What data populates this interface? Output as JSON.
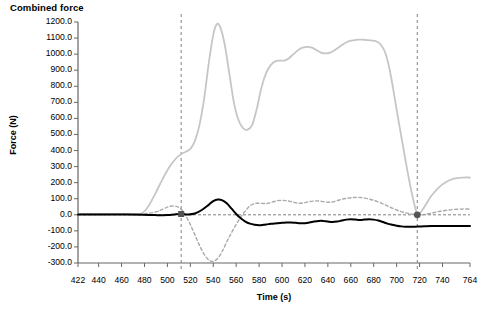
{
  "chart_data": {
    "type": "line",
    "title": "Combined force",
    "xlabel": "Time (s)",
    "ylabel": "Force (N)",
    "xlim": [
      422,
      764
    ],
    "ylim": [
      -300,
      1200
    ],
    "grid": false,
    "legend": "none",
    "y_ticks": [
      1200.0,
      1100.0,
      1000.0,
      900.0,
      800.0,
      700.0,
      600.0,
      500.0,
      400.0,
      300.0,
      200.0,
      100.0,
      0.0,
      -100.0,
      -200.0,
      -300.0
    ],
    "y_tick_labels": [
      "1200.0",
      "1100.0",
      "1000.0",
      "900.0",
      "800.0",
      "700.0",
      "600.0",
      "500.0",
      "400.0",
      "300.0",
      "200.0",
      "100.0",
      "0.0",
      "-100.0",
      "-200.0",
      "-300.0"
    ],
    "x_ticks": [
      422,
      440,
      460,
      480,
      500,
      520,
      540,
      560,
      580,
      600,
      620,
      640,
      660,
      680,
      700,
      720,
      740,
      764
    ],
    "x_tick_labels": [
      "422",
      "440",
      "460",
      "480",
      "500",
      "520",
      "540",
      "560",
      "580",
      "600",
      "620",
      "640",
      "660",
      "680",
      "700",
      "720",
      "740",
      "764"
    ],
    "annotations": {
      "zero_line": {
        "y": 0,
        "style": "dashed",
        "color": "#808080"
      },
      "vertical_markers": [
        {
          "x": 512,
          "style": "dashed",
          "color": "#808080"
        },
        {
          "x": 718,
          "style": "dashed",
          "color": "#808080"
        }
      ],
      "point_markers": [
        {
          "x": 512,
          "y": 5,
          "shape": "square",
          "color": "#555555",
          "series": "combined-force"
        },
        {
          "x": 718,
          "y": 0,
          "shape": "circle",
          "color": "#555555",
          "series": "combined-force"
        }
      ]
    },
    "series": [
      {
        "name": "vertical-force",
        "color": "#c6c6c6",
        "style": "solid",
        "width": 1.8,
        "x": [
          422,
          440,
          460,
          470,
          478,
          484,
          490,
          496,
          502,
          508,
          512,
          516,
          520,
          524,
          528,
          532,
          536,
          540,
          543,
          546,
          550,
          554,
          558,
          562,
          566,
          570,
          574,
          578,
          582,
          586,
          590,
          594,
          598,
          602,
          606,
          610,
          614,
          618,
          622,
          626,
          630,
          634,
          638,
          642,
          646,
          650,
          654,
          658,
          662,
          666,
          670,
          674,
          678,
          682,
          686,
          690,
          694,
          698,
          702,
          706,
          710,
          714,
          718,
          722,
          726,
          730,
          736,
          742,
          750,
          758,
          764
        ],
        "y": [
          5,
          5,
          5,
          6,
          10,
          60,
          140,
          225,
          300,
          355,
          378,
          392,
          410,
          460,
          560,
          720,
          940,
          1120,
          1185,
          1170,
          1060,
          880,
          700,
          590,
          540,
          530,
          560,
          660,
          790,
          880,
          930,
          955,
          960,
          960,
          975,
          1000,
          1025,
          1040,
          1045,
          1040,
          1025,
          1010,
          1005,
          1010,
          1025,
          1045,
          1065,
          1080,
          1085,
          1090,
          1090,
          1088,
          1085,
          1080,
          1060,
          1010,
          900,
          740,
          570,
          410,
          250,
          110,
          5,
          25,
          70,
          115,
          165,
          200,
          225,
          232,
          232
        ]
      },
      {
        "name": "horizontal-force",
        "color": "#aaaaaa",
        "style": "dashed",
        "width": 1.4,
        "x": [
          422,
          440,
          460,
          478,
          490,
          496,
          500,
          504,
          508,
          512,
          516,
          520,
          524,
          528,
          532,
          536,
          540,
          544,
          548,
          552,
          556,
          560,
          564,
          568,
          572,
          576,
          580,
          584,
          588,
          592,
          596,
          600,
          604,
          608,
          612,
          616,
          620,
          624,
          628,
          632,
          636,
          640,
          644,
          648,
          652,
          656,
          660,
          664,
          668,
          672,
          676,
          680,
          684,
          688,
          692,
          696,
          700,
          704,
          708,
          712,
          716,
          720,
          724,
          730,
          738,
          748,
          758,
          764
        ],
        "y": [
          2,
          2,
          3,
          5,
          18,
          35,
          48,
          55,
          52,
          35,
          -5,
          -60,
          -125,
          -190,
          -245,
          -280,
          -290,
          -270,
          -225,
          -165,
          -110,
          -60,
          -15,
          25,
          55,
          70,
          72,
          70,
          72,
          80,
          88,
          90,
          88,
          82,
          75,
          72,
          76,
          82,
          86,
          86,
          82,
          78,
          80,
          88,
          96,
          102,
          106,
          108,
          108,
          104,
          98,
          90,
          80,
          68,
          55,
          42,
          30,
          20,
          12,
          6,
          2,
          0,
          2,
          10,
          22,
          32,
          36,
          36
        ]
      },
      {
        "name": "combined-force",
        "color": "#000000",
        "style": "solid",
        "width": 2.0,
        "x": [
          422,
          440,
          460,
          478,
          490,
          500,
          506,
          512,
          518,
          524,
          530,
          536,
          540,
          544,
          548,
          552,
          556,
          560,
          564,
          568,
          572,
          576,
          580,
          584,
          588,
          592,
          596,
          600,
          604,
          608,
          612,
          616,
          620,
          624,
          628,
          632,
          636,
          640,
          644,
          648,
          652,
          656,
          660,
          664,
          668,
          672,
          676,
          680,
          684,
          688,
          692,
          696,
          700,
          704,
          708,
          712,
          716,
          720,
          724,
          730,
          738,
          748,
          758,
          764
        ],
        "y": [
          2,
          2,
          2,
          0,
          -2,
          -2,
          2,
          5,
          2,
          8,
          30,
          62,
          85,
          95,
          90,
          70,
          38,
          5,
          -22,
          -42,
          -55,
          -62,
          -65,
          -62,
          -58,
          -55,
          -52,
          -50,
          -48,
          -48,
          -50,
          -52,
          -52,
          -48,
          -42,
          -38,
          -38,
          -42,
          -45,
          -42,
          -36,
          -30,
          -28,
          -30,
          -32,
          -30,
          -28,
          -30,
          -36,
          -45,
          -55,
          -62,
          -68,
          -72,
          -74,
          -75,
          -74,
          -73,
          -72,
          -70,
          -70,
          -70,
          -70,
          -70
        ]
      }
    ]
  }
}
